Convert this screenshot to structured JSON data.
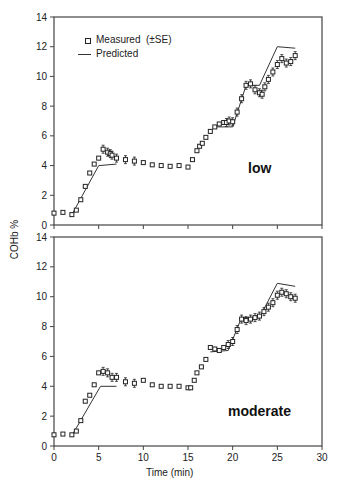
{
  "chart_data": [
    {
      "type": "line",
      "panel": "low",
      "xlabel": "Time (min)",
      "ylabel": "COHb %",
      "xlim": [
        0,
        30
      ],
      "ylim": [
        0,
        14
      ],
      "xticks": [
        0,
        5,
        10,
        15,
        20,
        25,
        30
      ],
      "yticks": [
        0,
        2,
        4,
        6,
        8,
        10,
        12,
        14
      ],
      "legend": {
        "measured": "Measured  (±SE)",
        "predicted": "Predicted"
      },
      "series": [
        {
          "name": "Measured",
          "x": [
            0,
            1,
            2,
            2.5,
            3,
            3.5,
            4,
            4.5,
            5,
            5.5,
            6,
            6.3,
            6.5,
            7,
            8,
            9,
            10,
            11,
            12,
            13,
            14,
            15,
            15.5,
            16,
            16.3,
            16.6,
            17,
            17.5,
            18,
            18.5,
            19,
            19.3,
            19.6,
            20,
            20.5,
            21,
            21.5,
            22,
            22.5,
            23,
            23.3,
            23.6,
            24,
            24.5,
            25,
            25.5,
            26,
            26.5,
            27
          ],
          "values": [
            0.8,
            0.85,
            0.7,
            1.0,
            1.7,
            2.6,
            3.5,
            4.1,
            4.5,
            5.1,
            4.9,
            4.8,
            4.7,
            4.5,
            4.4,
            4.3,
            4.2,
            4.05,
            4.0,
            3.95,
            4.0,
            3.9,
            4.4,
            5.0,
            5.3,
            5.5,
            5.9,
            6.3,
            6.6,
            6.8,
            6.9,
            6.9,
            7.0,
            6.95,
            7.6,
            8.5,
            9.4,
            9.5,
            9.1,
            8.9,
            8.8,
            9.3,
            9.8,
            10.3,
            10.8,
            11.2,
            10.9,
            11.0,
            11.4
          ]
        },
        {
          "name": "Predicted",
          "x": [
            2,
            5,
            7,
            15,
            18,
            20,
            21.5,
            23,
            25,
            27
          ],
          "values": [
            0.7,
            4.0,
            4.1,
            null,
            6.6,
            6.6,
            9.4,
            9.4,
            12.0,
            11.9
          ]
        }
      ]
    },
    {
      "type": "line",
      "panel": "moderate",
      "xlabel": "Time (min)",
      "ylabel": "COHb %",
      "xlim": [
        0,
        30
      ],
      "ylim": [
        0,
        14
      ],
      "xticks": [
        0,
        5,
        10,
        15,
        20,
        25,
        30
      ],
      "yticks": [
        0,
        2,
        4,
        6,
        8,
        10,
        12,
        14
      ],
      "series": [
        {
          "name": "Measured",
          "x": [
            0,
            1,
            2,
            2.5,
            3,
            3.5,
            4,
            4.5,
            5,
            5.5,
            6,
            6.5,
            7,
            8,
            9,
            10,
            11,
            12,
            13,
            14,
            15,
            15.3,
            15.7,
            16,
            16.5,
            17,
            17.5,
            18,
            18.5,
            19,
            19.5,
            20,
            20.5,
            21,
            21.5,
            22,
            22.5,
            23,
            23.5,
            24,
            24.5,
            25,
            25.5,
            26,
            26.5,
            27
          ],
          "values": [
            0.75,
            0.8,
            0.75,
            1.0,
            1.7,
            3.0,
            3.4,
            4.1,
            4.9,
            5.0,
            4.9,
            4.6,
            4.6,
            4.3,
            4.2,
            4.4,
            4.1,
            4.0,
            4.0,
            4.0,
            3.9,
            3.9,
            4.4,
            4.9,
            5.3,
            5.8,
            6.6,
            6.5,
            6.4,
            6.6,
            6.8,
            7.0,
            7.8,
            8.5,
            8.4,
            8.5,
            8.6,
            8.7,
            9.0,
            9.3,
            9.6,
            10.1,
            10.3,
            10.2,
            10.0,
            9.9
          ]
        },
        {
          "name": "Predicted",
          "x": [
            2,
            5.2,
            7,
            15,
            17.5,
            19.5,
            21,
            23,
            25,
            27
          ],
          "values": [
            0.7,
            4.0,
            4.0,
            null,
            6.3,
            6.4,
            8.6,
            8.6,
            10.9,
            10.7
          ]
        }
      ]
    }
  ],
  "axis": {
    "xlabel": "Time (min)",
    "ylabel": "COHb %",
    "xticks": [
      "0",
      "5",
      "10",
      "15",
      "20",
      "25",
      "30"
    ],
    "yticks": [
      "0",
      "2",
      "4",
      "6",
      "8",
      "10",
      "12",
      "14"
    ]
  },
  "legend": {
    "measured": "Measured  (±SE)",
    "predicted": "Predicted"
  },
  "panels": {
    "top": "low",
    "bottom": "moderate"
  },
  "colors": {
    "line": "#333333",
    "marker": "#222222",
    "axis": "#444444"
  }
}
